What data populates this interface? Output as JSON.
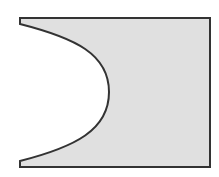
{
  "diagram": {
    "type": "shape",
    "canvas": {
      "width": 219,
      "height": 177,
      "background": "#ffffff"
    },
    "shape": {
      "fill": "#e0e0e0",
      "stroke": "#333333",
      "stroke_width": 2,
      "bounds": {
        "left": 20,
        "top": 18,
        "right": 210,
        "bottom": 167
      },
      "notch_top_y": 24,
      "notch_bottom_y": 161,
      "curve_apex": {
        "x": 109,
        "y": 92
      }
    }
  }
}
